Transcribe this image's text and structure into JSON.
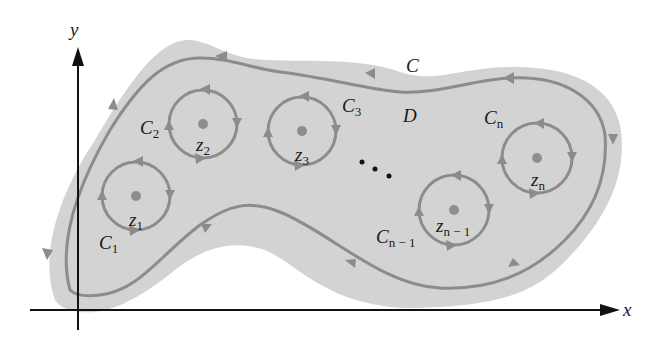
{
  "diagram": {
    "colors": {
      "region_fill": "#d3d3d3",
      "contour_stroke": "#8c8c8c",
      "point_fill": "#8e8e8e",
      "axis": "#111111",
      "text": "#1a1a1a"
    },
    "axes": {
      "x_label": "x",
      "y_label": "y"
    },
    "region_label": "D",
    "outer_contour_label": "C",
    "inner_contours": [
      {
        "name": "C",
        "sub": "1",
        "point": "z",
        "point_sub": "1"
      },
      {
        "name": "C",
        "sub": "2",
        "point": "z",
        "point_sub": "2"
      },
      {
        "name": "C",
        "sub": "3",
        "point": "z",
        "point_sub": "3"
      },
      {
        "name": "C",
        "sub": "n − 1",
        "point": "z",
        "point_sub": "n − 1"
      },
      {
        "name": "C",
        "sub": "n",
        "point": "z",
        "point_sub": "n"
      }
    ],
    "ellipsis": "• • •"
  }
}
